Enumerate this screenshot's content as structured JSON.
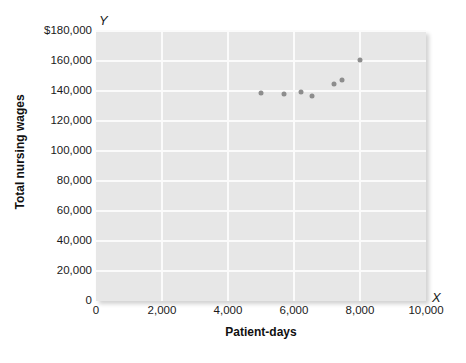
{
  "chart_data": {
    "type": "scatter",
    "title": "",
    "xlabel": "Patient-days",
    "ylabel": "Total nursing wages",
    "x_axis_letter": "X",
    "y_axis_letter": "Y",
    "xlim": [
      0,
      10000
    ],
    "ylim": [
      0,
      180000
    ],
    "grid": true,
    "legend": "none",
    "plot_background_color": "#e7e7e7",
    "gridline_color": "#fbfbfb",
    "point_color": "#8d8d8d",
    "xticks": [
      {
        "value": 0,
        "label": "0"
      },
      {
        "value": 2000,
        "label": "2,000"
      },
      {
        "value": 4000,
        "label": "4,000"
      },
      {
        "value": 6000,
        "label": "6,000"
      },
      {
        "value": 8000,
        "label": "8,000"
      },
      {
        "value": 10000,
        "label": "10,000"
      }
    ],
    "yticks": [
      {
        "value": 0,
        "label": "0"
      },
      {
        "value": 20000,
        "label": "20,000"
      },
      {
        "value": 40000,
        "label": "40,000"
      },
      {
        "value": 60000,
        "label": "60,000"
      },
      {
        "value": 80000,
        "label": "80,000"
      },
      {
        "value": 100000,
        "label": "100,000"
      },
      {
        "value": 120000,
        "label": "120,000"
      },
      {
        "value": 140000,
        "label": "140,000"
      },
      {
        "value": 160000,
        "label": "160,000"
      },
      {
        "value": 180000,
        "label": "$180,000"
      }
    ],
    "points": [
      {
        "x": 5000,
        "y": 139000
      },
      {
        "x": 5700,
        "y": 138000
      },
      {
        "x": 6200,
        "y": 139500
      },
      {
        "x": 6550,
        "y": 136500
      },
      {
        "x": 7200,
        "y": 145000
      },
      {
        "x": 7450,
        "y": 147500
      },
      {
        "x": 8000,
        "y": 161000
      }
    ]
  }
}
